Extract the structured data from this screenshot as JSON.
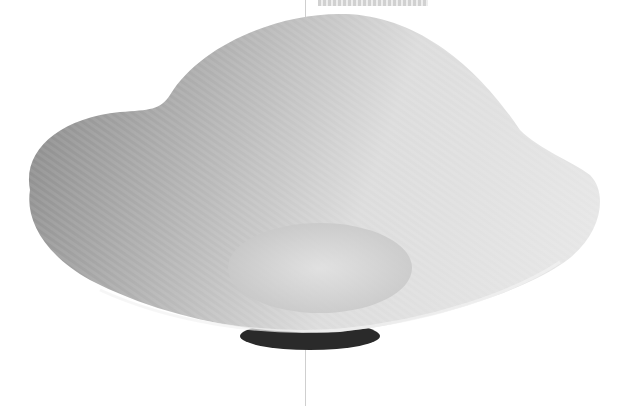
{
  "scene": {
    "subject": "lobed white porcelain dish",
    "view": "three-quarter side view",
    "palette": {
      "background": "#ffffff",
      "glaze_light": "#e9e9e9",
      "glaze_mid": "#c8c8c8",
      "glaze_shadow": "#8f8f8f",
      "foot_ring": "#2a2a2a",
      "divider_line": "#cfcfcf"
    }
  }
}
